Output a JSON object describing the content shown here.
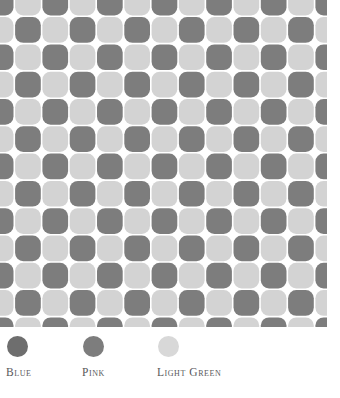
{
  "pattern": {
    "name": "rounded-checkerboard-pattern",
    "tile_pitch": 27.3,
    "corner_radius": 8.2,
    "gap": 1.6,
    "offset_x": -13.0,
    "offset_y": -11.0,
    "background_color": "#ffffff",
    "dark_color": "#7d7d7d",
    "light_color": "#d3d3d3",
    "columns": 14,
    "rows": 14
  },
  "legend": {
    "items": [
      {
        "label": "Blue",
        "color": "#6e6e6e"
      },
      {
        "label": "Pink",
        "color": "#7d7d7d"
      },
      {
        "label": "Light Green",
        "color": "#d8d8d8"
      }
    ]
  }
}
